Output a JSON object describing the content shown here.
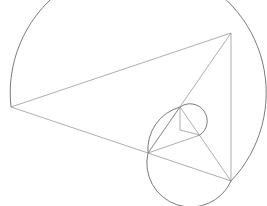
{
  "diagram": {
    "type": "golden-triangle-spiral",
    "colors": {
      "background": "#ffffff",
      "arc": "#6b6b6b",
      "edge": "#8a8a8a"
    },
    "vertices": {
      "A": [
        11,
        107
      ],
      "B": [
        231,
        33
      ],
      "C": [
        231,
        181
      ],
      "D": [
        148,
        153
      ],
      "E": [
        180,
        107
      ],
      "F": [
        200,
        135
      ],
      "G": [
        180,
        130
      ]
    },
    "edges": [
      [
        "A",
        "B"
      ],
      [
        "A",
        "D"
      ],
      [
        "B",
        "C"
      ],
      [
        "B",
        "D"
      ],
      [
        "D",
        "C"
      ],
      [
        "E",
        "D"
      ],
      [
        "E",
        "C"
      ],
      [
        "D",
        "F"
      ],
      [
        "E",
        "G"
      ],
      [
        "G",
        "F"
      ]
    ],
    "arcs": [
      {
        "name": "large-arc",
        "path": "M 11 107 A 128 128 0 1 1 231 181"
      },
      {
        "name": "medium-arc",
        "path": "M 231 181 A 44 44 0 0 1 148 153 A 44 44 0 0 1 180 107"
      },
      {
        "name": "small-arc",
        "path": "M 180 107 A 15 15 0 0 1 200 135"
      }
    ]
  }
}
